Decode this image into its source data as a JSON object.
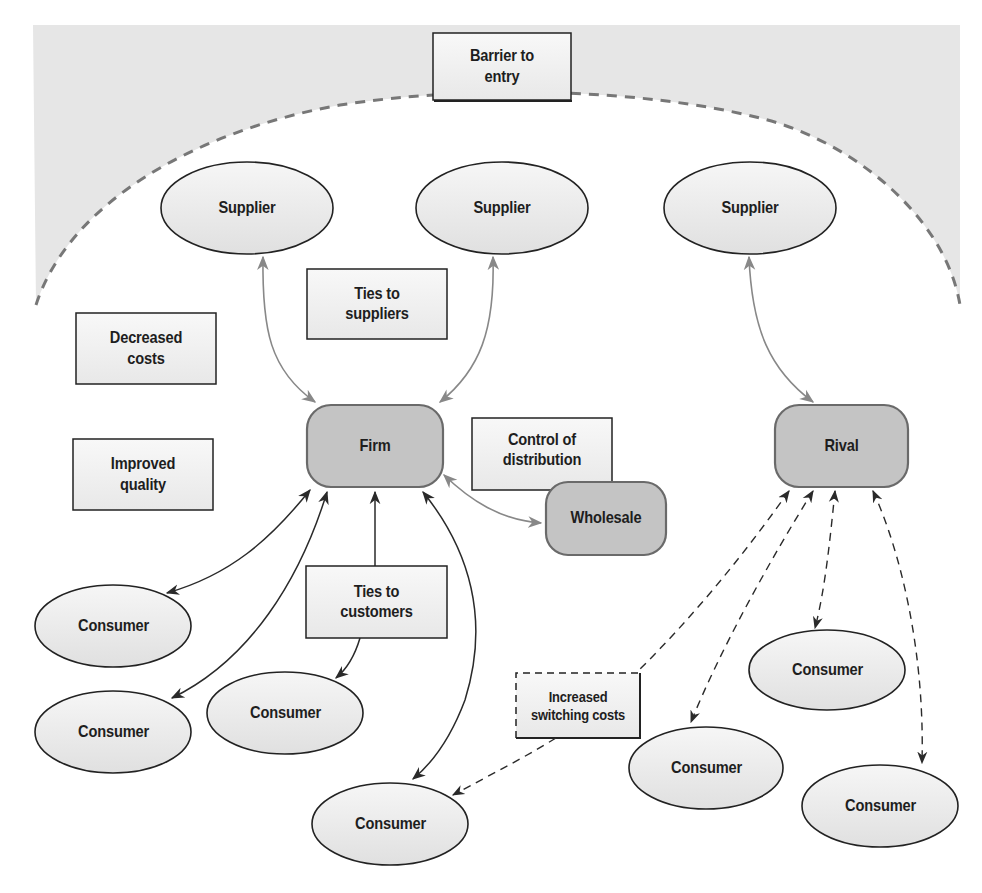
{
  "diagram": {
    "colors": {
      "barrier_fill": "#e6e6e6",
      "barrier_stroke": "#777777",
      "ellipse_fill": "#ececec",
      "ellipse_stroke": "#222222",
      "rounded_fill": "#c4c4c4",
      "rounded_stroke": "#6a6a6a",
      "box_fill": "#f2f2f2",
      "box_stroke": "#222222",
      "supplier_arrow": "#888888",
      "consumer_arrow": "#2a2a2a"
    },
    "barrier": {
      "label_line1": "Barrier to",
      "label_line2": "entry"
    },
    "suppliers": [
      {
        "label": "Supplier"
      },
      {
        "label": "Supplier"
      },
      {
        "label": "Supplier"
      }
    ],
    "firm": {
      "label": "Firm"
    },
    "rival": {
      "label": "Rival"
    },
    "wholesale": {
      "label": "Wholesale"
    },
    "boxes": {
      "ties_to_suppliers": {
        "line1": "Ties to",
        "line2": "suppliers"
      },
      "decreased_costs": {
        "line1": "Decreased",
        "line2": "costs"
      },
      "improved_quality": {
        "line1": "Improved",
        "line2": "quality"
      },
      "control_of_distribution": {
        "line1": "Control of",
        "line2": "distribution"
      },
      "ties_to_customers": {
        "line1": "Ties to",
        "line2": "customers"
      },
      "increased_switching_costs": {
        "line1": "Increased",
        "line2": "switching costs"
      }
    },
    "consumers": [
      {
        "label": "Consumer"
      },
      {
        "label": "Consumer"
      },
      {
        "label": "Consumer"
      },
      {
        "label": "Consumer"
      },
      {
        "label": "Consumer"
      },
      {
        "label": "Consumer"
      },
      {
        "label": "Consumer"
      }
    ]
  }
}
